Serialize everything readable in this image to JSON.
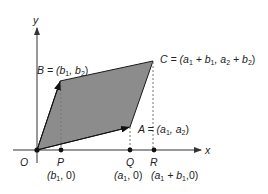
{
  "colors": {
    "fill": "#8c8c8c",
    "stroke": "#1a1a1a",
    "axis": "#333333",
    "dash": "#777777"
  },
  "axes": {
    "x_label": "x",
    "y_label": "y",
    "origin_label": "O"
  },
  "points": {
    "A": {
      "name": "A",
      "coords": "(a1, a2)"
    },
    "B": {
      "name": "B",
      "coords": "(b1, b2)"
    },
    "C": {
      "name": "C",
      "coords": "(a1 + b1, a2 + b2)"
    },
    "P": {
      "name": "P",
      "coords": "(b1, 0)"
    },
    "Q": {
      "name": "Q",
      "coords": "(a1, 0)"
    },
    "R": {
      "name": "R",
      "coords": "(a1 + b1,0)"
    }
  },
  "labels": {
    "A_eq": "A = (",
    "A_a": "a",
    "A_sub1": "1",
    "A_mid": ", a",
    "A_sub2": "2",
    "A_end": ")",
    "B_eq": "B = (",
    "B_b": "b",
    "B_sub1": "1",
    "B_mid": ", b",
    "B_sub2": "2",
    "B_end": ")",
    "C_eq": "C = (a",
    "C_s1": "1",
    "C_p1": " + b",
    "C_s2": "1",
    "C_mid": ", a",
    "C_s3": "2",
    "C_p2": " + b",
    "C_s4": "2",
    "C_end": ")",
    "P_open": "(b",
    "P_sub": "1",
    "P_close": ", 0)",
    "Q_open": "(a",
    "Q_sub": "1",
    "Q_close": ", 0)",
    "R_open": "(a",
    "R_sub": "1",
    "R_mid": " + b",
    "R_sub2": "1",
    "R_close": ",0)"
  }
}
